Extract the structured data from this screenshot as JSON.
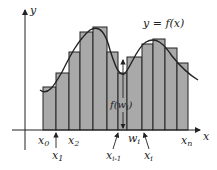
{
  "figure": {
    "curve_label": "y = f(x)",
    "y_axis_label": "y",
    "x_axis_label": "x",
    "height_label": "f(w_i)",
    "labels": {
      "x0": "x",
      "x0_sub": "0",
      "x1": "x",
      "x1_sub": "1",
      "x2": "x",
      "x2_sub": "2",
      "xim1": "x",
      "xim1_sub": "i-1",
      "wi": "w",
      "wi_sub": "i",
      "xi": "x",
      "xi_sub": "i",
      "xn": "x",
      "xn_sub": "n",
      "f_open": "f(w",
      "f_sub": "i",
      "f_close": ")"
    },
    "colors": {
      "bar_fill": "#a9a9a9",
      "bar_stroke": "#222222",
      "curve": "#222222",
      "axis": "#222222",
      "background": "#ffffff"
    }
  },
  "chart_data": {
    "type": "bar",
    "xlabel": "x",
    "ylabel": "y",
    "bar_edges_px": [
      43,
      56,
      69,
      80,
      93,
      107,
      118,
      127,
      142,
      153,
      165,
      177,
      188
    ],
    "bar_tops_px": [
      87,
      73,
      52,
      32,
      27,
      52,
      73,
      57,
      44,
      39,
      48,
      63
    ],
    "baseline_px": 130,
    "curve_label": "y = f(x)"
  }
}
